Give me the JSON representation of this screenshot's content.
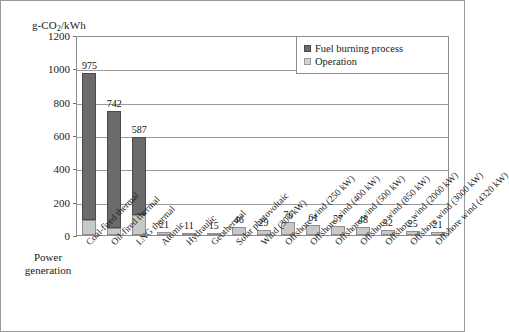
{
  "figure": {
    "yaxis_title_main": "g-CO",
    "yaxis_title_sub": "2",
    "yaxis_title_tail": "/kWh",
    "xaxis_title_line1": "Power",
    "xaxis_title_line2": "generation"
  },
  "legend": {
    "position": "top-right-inside",
    "items": [
      {
        "label": "Fuel burning process",
        "color": "#6b6b6b"
      },
      {
        "label": "Operation",
        "color": "#d2d2d2"
      }
    ]
  },
  "chart_data": {
    "type": "bar",
    "subtype": "stacked-bar",
    "title": "",
    "xlabel": "Power generation",
    "ylabel": "g-CO2/kWh",
    "ylim": [
      0,
      1200
    ],
    "yticks": [
      0,
      200,
      400,
      600,
      800,
      1000,
      1200
    ],
    "grid": true,
    "grid_axis": "y",
    "legend_position": "upper right",
    "categories": [
      "Coal-fired thermal",
      "Oil-fired thermal",
      "LNG thermal",
      "Atomic",
      "Hydraulic",
      "Geothermal",
      "Solar photovoltaic",
      "Wind (300 kW)",
      "Offshore wind (250 kW)",
      "Offshore wind (400 kW)",
      "Offshore wind (500 kW)",
      "Offshore wind (850 kW)",
      "Offshore wind (2000 kW)",
      "Offshore wind (3000 kW)",
      "Offshore wind (4320 kW)"
    ],
    "totals": [
      975,
      742,
      587,
      21,
      11,
      15,
      46,
      29,
      76,
      61,
      57,
      48,
      32,
      25,
      21
    ],
    "series": [
      {
        "name": "Fuel burning process",
        "color": "#6b6b6b",
        "values": [
          887,
          700,
          465,
          0,
          0,
          0,
          0,
          0,
          0,
          0,
          0,
          0,
          0,
          0,
          0
        ]
      },
      {
        "name": "Operation",
        "color": "#c8c8c8",
        "values": [
          88,
          42,
          122,
          21,
          11,
          15,
          46,
          29,
          76,
          61,
          57,
          48,
          32,
          25,
          21
        ]
      }
    ],
    "bars": [
      {
        "category": "Coal-fired thermal",
        "label": "975",
        "total": 975,
        "fuel": 887,
        "operation": 88
      },
      {
        "category": "Oil-fired thermal",
        "label": "742",
        "total": 742,
        "fuel": 700,
        "operation": 42
      },
      {
        "category": "LNG thermal",
        "label": "587",
        "total": 587,
        "fuel": 465,
        "operation": 122
      },
      {
        "category": "Atomic",
        "label": "21",
        "total": 21,
        "fuel": 0,
        "operation": 21
      },
      {
        "category": "Hydraulic",
        "label": "11",
        "total": 11,
        "fuel": 0,
        "operation": 11
      },
      {
        "category": "Geothermal",
        "label": "15",
        "total": 15,
        "fuel": 0,
        "operation": 15
      },
      {
        "category": "Solar photovoltaic",
        "label": "46",
        "total": 46,
        "fuel": 0,
        "operation": 46
      },
      {
        "category": "Wind (300 kW)",
        "label": "29",
        "total": 29,
        "fuel": 0,
        "operation": 29
      },
      {
        "category": "Offshore wind (250 kW)",
        "label": "76",
        "total": 76,
        "fuel": 0,
        "operation": 76
      },
      {
        "category": "Offshore wind (400 kW)",
        "label": "61",
        "total": 61,
        "fuel": 0,
        "operation": 61
      },
      {
        "category": "Offshore wind (500 kW)",
        "label": "57",
        "total": 57,
        "fuel": 0,
        "operation": 57
      },
      {
        "category": "Offshore wind (850 kW)",
        "label": "48",
        "total": 48,
        "fuel": 0,
        "operation": 48
      },
      {
        "category": "Offshore wind (2000 kW)",
        "label": "32",
        "total": 32,
        "fuel": 0,
        "operation": 32
      },
      {
        "category": "Offshore wind (3000 kW)",
        "label": "25",
        "total": 25,
        "fuel": 0,
        "operation": 25
      },
      {
        "category": "Offshore wind (4320 kW)",
        "label": "21",
        "total": 21,
        "fuel": 0,
        "operation": 21
      }
    ]
  }
}
